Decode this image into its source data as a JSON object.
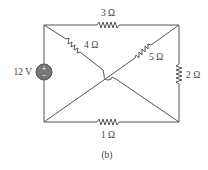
{
  "figure": {
    "caption": "(b)"
  },
  "source": {
    "label": "12 V",
    "plus": "+",
    "minus": "−",
    "fill_color": "#777777"
  },
  "resistors": [
    {
      "id": "r3",
      "label": "3 Ω",
      "position": "top"
    },
    {
      "id": "r4",
      "label": "4 Ω",
      "position": "diagonal-top-left"
    },
    {
      "id": "r5",
      "label": "5 Ω",
      "position": "diagonal-top-right"
    },
    {
      "id": "r2",
      "label": "2 Ω",
      "position": "right"
    },
    {
      "id": "r1",
      "label": "1 Ω",
      "position": "bottom"
    }
  ],
  "colors": {
    "wire": "#555555",
    "text": "#444444",
    "background": "#ffffff"
  }
}
